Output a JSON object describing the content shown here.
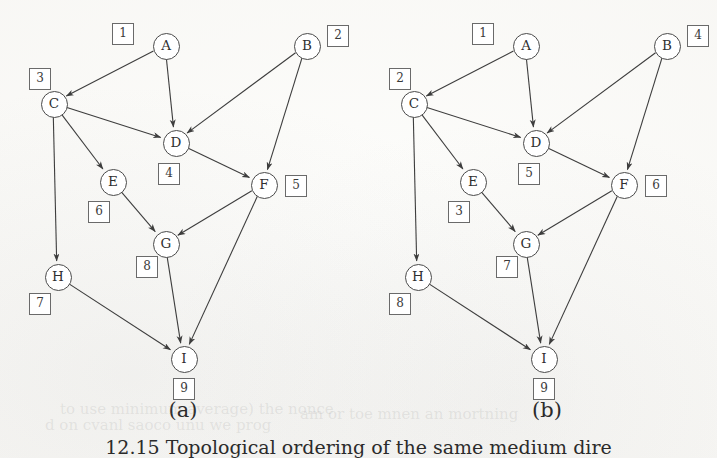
{
  "figure": {
    "caption": "12.15  Topological ordering of the same medium dire",
    "panels": [
      {
        "id": "a",
        "label": "(a)"
      },
      {
        "id": "b",
        "label": "(b)"
      }
    ]
  },
  "graph": {
    "nodes": [
      {
        "id": "A",
        "label": "A",
        "x": 165,
        "y": 45
      },
      {
        "id": "B",
        "label": "B",
        "x": 306,
        "y": 45
      },
      {
        "id": "C",
        "label": "C",
        "x": 53,
        "y": 103
      },
      {
        "id": "D",
        "label": "D",
        "x": 175,
        "y": 142
      },
      {
        "id": "E",
        "label": "E",
        "x": 112,
        "y": 181
      },
      {
        "id": "F",
        "label": "F",
        "x": 263,
        "y": 184
      },
      {
        "id": "G",
        "label": "G",
        "x": 165,
        "y": 243
      },
      {
        "id": "H",
        "label": "H",
        "x": 57,
        "y": 276
      },
      {
        "id": "I",
        "label": "I",
        "x": 183,
        "y": 358
      }
    ],
    "edges": [
      {
        "from": "A",
        "to": "C"
      },
      {
        "from": "A",
        "to": "D"
      },
      {
        "from": "B",
        "to": "D"
      },
      {
        "from": "B",
        "to": "F"
      },
      {
        "from": "C",
        "to": "D"
      },
      {
        "from": "C",
        "to": "E"
      },
      {
        "from": "C",
        "to": "H"
      },
      {
        "from": "D",
        "to": "F"
      },
      {
        "from": "E",
        "to": "G"
      },
      {
        "from": "F",
        "to": "G"
      },
      {
        "from": "F",
        "to": "I"
      },
      {
        "from": "G",
        "to": "I"
      },
      {
        "from": "H",
        "to": "I"
      }
    ]
  },
  "panel_a": {
    "label": "(a)",
    "label_x": 143,
    "label_y": 398,
    "offset_x": 0,
    "order_boxes": [
      {
        "node": "A",
        "order": "1",
        "x": 112,
        "y": 23
      },
      {
        "node": "B",
        "order": "2",
        "x": 327,
        "y": 25
      },
      {
        "node": "C",
        "order": "3",
        "x": 29,
        "y": 68
      },
      {
        "node": "D",
        "order": "4",
        "x": 158,
        "y": 163
      },
      {
        "node": "F",
        "order": "5",
        "x": 285,
        "y": 175
      },
      {
        "node": "E",
        "order": "6",
        "x": 88,
        "y": 201
      },
      {
        "node": "H",
        "order": "7",
        "x": 29,
        "y": 293
      },
      {
        "node": "G",
        "order": "8",
        "x": 136,
        "y": 256
      },
      {
        "node": "I",
        "order": "9",
        "x": 173,
        "y": 378
      }
    ],
    "ordering": [
      "A",
      "B",
      "C",
      "D",
      "F",
      "E",
      "H",
      "G",
      "I"
    ]
  },
  "panel_b": {
    "label": "(b)",
    "label_x": 507,
    "label_y": 398,
    "offset_x": 360,
    "order_boxes": [
      {
        "node": "A",
        "order": "1",
        "x": 112,
        "y": 23
      },
      {
        "node": "C",
        "order": "2",
        "x": 29,
        "y": 68
      },
      {
        "node": "E",
        "order": "3",
        "x": 88,
        "y": 201
      },
      {
        "node": "B",
        "order": "4",
        "x": 327,
        "y": 25
      },
      {
        "node": "D",
        "order": "5",
        "x": 158,
        "y": 163
      },
      {
        "node": "F",
        "order": "6",
        "x": 285,
        "y": 175
      },
      {
        "node": "G",
        "order": "7",
        "x": 136,
        "y": 256
      },
      {
        "node": "H",
        "order": "8",
        "x": 29,
        "y": 293
      },
      {
        "node": "I",
        "order": "9",
        "x": 173,
        "y": 378
      }
    ],
    "ordering": [
      "A",
      "C",
      "E",
      "B",
      "D",
      "F",
      "G",
      "H",
      "I"
    ]
  },
  "style": {
    "ink": "#3d3d3d",
    "node_stroke": "#4a4a4a",
    "box_stroke": "#6a6a6a",
    "paper": "#fdfdfb"
  },
  "bleed_text": [
    {
      "text": "to use minimum average) the nonce",
      "x": 60,
      "y": 400
    },
    {
      "text": "d on cvanl saoco unu we prog",
      "x": 45,
      "y": 416
    },
    {
      "text": "am or toe mnen an mortning",
      "x": 300,
      "y": 405
    }
  ]
}
